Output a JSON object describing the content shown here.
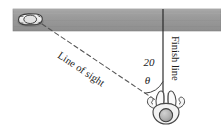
{
  "figure": {
    "background_color": "#ffffff"
  },
  "road": {
    "name": "road",
    "fill_color": "#9c9c9c",
    "edge_color": "#7d7d7d",
    "x": 13,
    "y": 9,
    "width": 208,
    "height": 22
  },
  "car": {
    "name": "car",
    "label": "car",
    "body_color": "#f0f0f0",
    "outline_color": "#3c3c3c",
    "center_x": 30,
    "center_y": 20
  },
  "runner": {
    "name": "runner",
    "label": "runner",
    "head_color": "#b4b4b4",
    "outline_color": "#4a4a4a",
    "center_x": 166,
    "center_y": 115
  },
  "finish_line": {
    "label": "Finish line",
    "color": "#2a2a2a",
    "x": 163,
    "y_top": 9,
    "y_bottom": 104
  },
  "line_of_sight": {
    "label": "Line of sight",
    "style": "dashed",
    "color": "#5a5a5a",
    "x1": 42,
    "y1": 24,
    "x2": 160,
    "y2": 103
  },
  "distance_label": {
    "value": "20",
    "units": "",
    "x": 150,
    "y": 63
  },
  "angle_label": {
    "symbol": "θ",
    "x": 148,
    "y": 83
  },
  "angle_arc": {
    "name": "angle-arc",
    "color": "#3a3a3a",
    "radius": 22
  }
}
